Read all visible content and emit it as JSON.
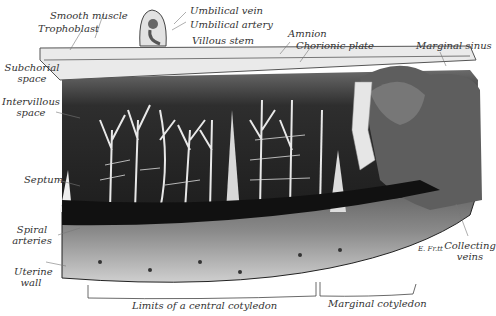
{
  "figure": {
    "labels": {
      "smooth_muscle": "Smooth muscle",
      "trophoblast": "Trophoblast",
      "umbilical_vein": "Umbilical vein",
      "umbilical_artery": "Umbilical artery",
      "villous_stem": "Villous stem",
      "amnion": "Amnion",
      "chorionic_plate": "Chorionic plate",
      "marginal_sinus": "Marginal sinus",
      "subchorial_space_1": "Subchorial",
      "subchorial_space_2": "space",
      "intervillous_space_1": "Intervillous",
      "intervillous_space_2": "space",
      "septum": "Septum",
      "spiral_arteries_1": "Spiral",
      "spiral_arteries_2": "arteries",
      "uterine_wall_1": "Uterine",
      "uterine_wall_2": "wall",
      "collecting_veins_1": "Collecting",
      "collecting_veins_2": "veins",
      "central_cotyledon": "Limits of a central cotyledon",
      "marginal_cotyledon": "Marginal cotyledon",
      "signature": "E. Fr.tt"
    }
  }
}
